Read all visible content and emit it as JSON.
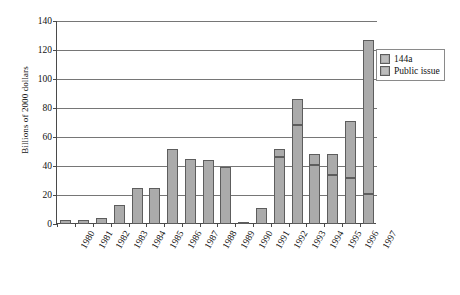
{
  "chart_data": {
    "type": "bar",
    "subtype": "stacked-vertical",
    "title": "",
    "xlabel": "",
    "ylabel": "Billions of 2000 dollars",
    "ylim": [
      0,
      140
    ],
    "yticks": [
      0,
      20,
      40,
      60,
      80,
      100,
      120,
      140
    ],
    "ytick_labels": [
      "0",
      "20",
      "40",
      "60",
      "80",
      "100",
      "120",
      "140"
    ],
    "grid": "horizontal",
    "legend_position": "upper-right-outside",
    "categories": [
      "1980",
      "1981",
      "1982",
      "1983",
      "1984",
      "1985",
      "1986",
      "1987",
      "1988",
      "1989",
      "1990",
      "1991",
      "1992",
      "1993",
      "1994",
      "1995",
      "1996",
      "1997"
    ],
    "series": [
      {
        "name": "Public issue",
        "color": "#ababab",
        "values": [
          3,
          2.5,
          4,
          13,
          25,
          25,
          52,
          45,
          44,
          39,
          1,
          11,
          46,
          68,
          41,
          34,
          32,
          21
        ]
      },
      {
        "name": "144a",
        "color": "#ababab",
        "values": [
          0,
          0,
          0,
          0,
          0,
          0,
          0,
          0,
          0,
          0,
          0,
          0,
          6,
          18,
          7,
          14,
          39,
          106
        ]
      }
    ],
    "totals": [
      3,
      2.5,
      4,
      13,
      25,
      25,
      52,
      45,
      44,
      39,
      1,
      11,
      52,
      86,
      48,
      48,
      71,
      127
    ]
  },
  "legend": {
    "entries": [
      {
        "label": "144a",
        "swatch_color": "#ababab"
      },
      {
        "label": "Public issue",
        "swatch_color": "#ababab"
      }
    ]
  }
}
